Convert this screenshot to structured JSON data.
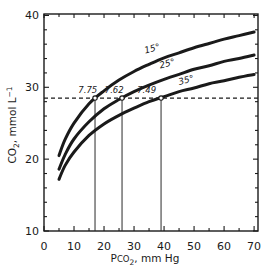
{
  "chart_data": {
    "type": "line",
    "title": "",
    "xlabel_parts": {
      "prefix": "P",
      "smallcaps": "CO",
      "subscript": "2",
      "suffix": ", mm Hg"
    },
    "ylabel_parts": {
      "main": "CO",
      "subscript": "2",
      "middle": ", mmol L",
      "superscript": "−1"
    },
    "xlim": [
      0,
      71.3
    ],
    "ylim": [
      10,
      40.2
    ],
    "x_major_ticks": [
      0,
      10,
      20,
      30,
      40,
      50,
      60,
      70
    ],
    "x_minor_ticks": [
      5,
      15,
      25,
      35,
      45,
      55,
      65
    ],
    "y_major_ticks": [
      10,
      20,
      30,
      40
    ],
    "y_minor_ticks": [
      12,
      14,
      16,
      18,
      22,
      24,
      26,
      28,
      32,
      34,
      36,
      38
    ],
    "grid": false,
    "frame": "box",
    "legend_position": "on-curve",
    "ink_color": "#1a1a1a",
    "background_color": "#ffffff",
    "series": [
      {
        "name": "15°",
        "label_anchor": {
          "x": 36.3,
          "y": 35.0
        },
        "x": [
          5,
          7,
          10,
          15,
          20,
          25,
          30,
          35,
          40,
          45,
          50,
          55,
          60,
          65,
          70
        ],
        "y": [
          20.5,
          22.7,
          25.0,
          27.7,
          29.5,
          31.0,
          32.2,
          33.2,
          34.1,
          34.8,
          35.5,
          36.1,
          36.7,
          37.2,
          37.7
        ]
      },
      {
        "name": "25°",
        "label_anchor": {
          "x": 41.3,
          "y": 32.9
        },
        "x": [
          5,
          7,
          10,
          15,
          20,
          25,
          30,
          35,
          40,
          45,
          50,
          55,
          60,
          65,
          70
        ],
        "y": [
          18.6,
          20.6,
          22.8,
          25.2,
          27.0,
          28.3,
          29.4,
          30.3,
          31.1,
          31.8,
          32.5,
          33.0,
          33.6,
          34.0,
          34.5
        ]
      },
      {
        "name": "35°",
        "label_anchor": {
          "x": 47.6,
          "y": 30.6
        },
        "x": [
          5,
          7,
          10,
          15,
          20,
          25,
          30,
          35,
          40,
          45,
          50,
          55,
          60,
          65,
          70
        ],
        "y": [
          17.2,
          19.1,
          21.0,
          23.3,
          24.9,
          26.1,
          27.1,
          28.0,
          28.7,
          29.4,
          29.9,
          30.5,
          30.9,
          31.4,
          31.8
        ]
      }
    ],
    "isopleth": {
      "value": 28.5,
      "style": "dashed"
    },
    "drop_lines": [
      {
        "x": 17,
        "marker": "open-circle"
      },
      {
        "x": 26,
        "marker": "open-circle"
      },
      {
        "x": 39,
        "marker": "open-circle"
      }
    ],
    "annotations": [
      {
        "text": "7.75",
        "x": 14.6,
        "y": 29.2
      },
      {
        "text": "7.62",
        "x": 23.4,
        "y": 29.2
      },
      {
        "text": "7.49",
        "x": 34.2,
        "y": 29.2
      }
    ]
  }
}
